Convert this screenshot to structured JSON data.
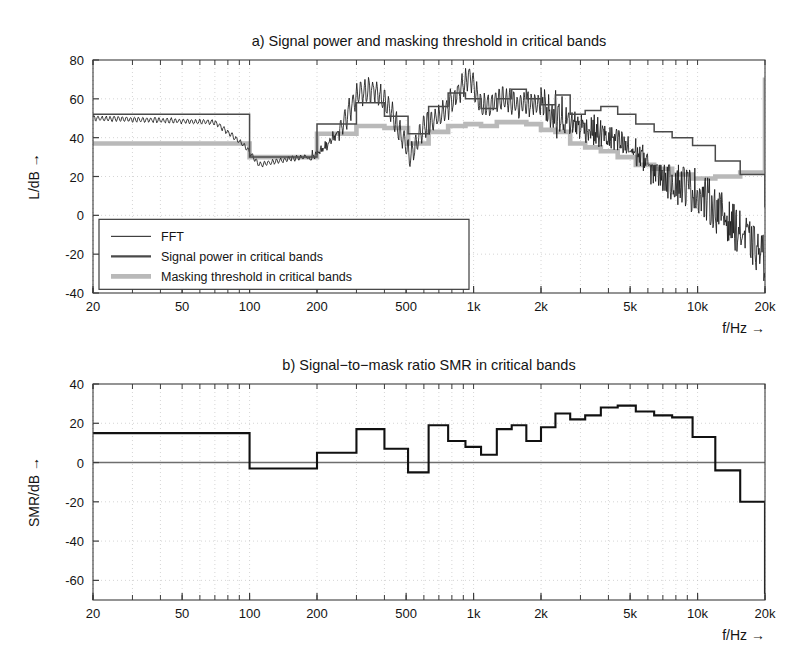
{
  "figure": {
    "width": 809,
    "height": 661,
    "background": "#ffffff"
  },
  "colors": {
    "axis": "#3c3c3c",
    "grid": "#b4b4b4",
    "fft": "#1a1a1a",
    "signal_power": "#4a4a4a",
    "masking_threshold": "#b9b9b9",
    "smr": "#111111",
    "zero_line": "#6e6e6e",
    "legend_border": "#3c3c3c",
    "legend_bg": "#ffffff"
  },
  "chart_data": [
    {
      "id": "panel-a",
      "type": "line",
      "title": "a) Signal power and masking threshold in critical bands",
      "xlabel": "f/Hz →",
      "ylabel": "L/dB →",
      "xscale": "log",
      "xlim": [
        20,
        20000
      ],
      "ylim": [
        -40,
        80
      ],
      "yticks": [
        -40,
        -20,
        0,
        20,
        40,
        60,
        80
      ],
      "ytick_labels": [
        "-40",
        "-20",
        "0",
        "20",
        "40",
        "60",
        "80"
      ],
      "xticks": [
        20,
        50,
        100,
        200,
        500,
        1000,
        2000,
        5000,
        10000,
        20000
      ],
      "xtick_labels": [
        "20",
        "50",
        "100",
        "200",
        "500",
        "1k",
        "2k",
        "5k",
        "10k",
        "20k"
      ],
      "grid": true,
      "legend_position": "lower-left",
      "legend": [
        {
          "label": "FFT",
          "style": "thin-dark-line"
        },
        {
          "label": "Signal power in critical bands",
          "style": "thick-dark-line"
        },
        {
          "label": "Masking threshold in critical bands",
          "style": "thick-gray-line"
        }
      ],
      "series": [
        {
          "name": "Signal power in critical bands",
          "style": "staircase",
          "band_edges": [
            20,
            100,
            200,
            300,
            400,
            510,
            630,
            770,
            920,
            1080,
            1270,
            1480,
            1720,
            2000,
            2320,
            2700,
            3150,
            3700,
            4400,
            5300,
            6400,
            7700,
            9500,
            12000,
            15500,
            20000
          ],
          "values": [
            52,
            30,
            47,
            58,
            51,
            42,
            56,
            63,
            60,
            55,
            60,
            65,
            60,
            57,
            62,
            52,
            54,
            56,
            52,
            47,
            43,
            40,
            36,
            28,
            21,
            4
          ]
        },
        {
          "name": "Masking threshold in critical bands",
          "style": "staircase",
          "band_edges": [
            20,
            100,
            200,
            300,
            400,
            510,
            630,
            770,
            920,
            1080,
            1270,
            1480,
            1720,
            2000,
            2320,
            2700,
            3150,
            3700,
            4400,
            5300,
            6400,
            7700,
            9500,
            12000,
            15500,
            20000
          ],
          "values": [
            37,
            30,
            42,
            46,
            45,
            37,
            43,
            46,
            47,
            46,
            48,
            48,
            47,
            44,
            43,
            37,
            35,
            33,
            30,
            26,
            24,
            21,
            19,
            20,
            22,
            71
          ]
        },
        {
          "name": "FFT",
          "style": "spectrum",
          "description": "Fine-grained FFT magnitude spectrum: flat near 50 dB below 100 Hz, falling to about 26 dB near 110 Hz, rising with strong tonal peaks between 200 Hz and 2 kHz reaching about 72 dB near 1 kHz, then decaying with dense noise to about -30 dB at 20 kHz",
          "anchors_hz": [
            20,
            40,
            70,
            95,
            110,
            150,
            200,
            260,
            300,
            360,
            420,
            480,
            520,
            600,
            700,
            820,
            950,
            1100,
            1300,
            1600,
            2000,
            2500,
            3200,
            4000,
            5000,
            6400,
            8000,
            10000,
            12500,
            16000,
            20000
          ],
          "anchors_db": [
            50,
            49,
            48,
            36,
            26,
            29,
            31,
            46,
            62,
            65,
            55,
            40,
            30,
            46,
            51,
            60,
            72,
            55,
            60,
            57,
            58,
            49,
            45,
            40,
            34,
            26,
            18,
            12,
            2,
            -10,
            -22
          ],
          "noise_floor_db": -35
        }
      ]
    },
    {
      "id": "panel-b",
      "type": "line",
      "title": "b) Signal−to−mask ratio SMR in critical bands",
      "xlabel": "f/Hz →",
      "ylabel": "SMR/dB →",
      "xscale": "log",
      "xlim": [
        20,
        20000
      ],
      "ylim": [
        -70,
        40
      ],
      "yticks": [
        -60,
        -40,
        -20,
        0,
        20,
        40
      ],
      "ytick_labels": [
        "-60",
        "-40",
        "-20",
        "0",
        "20",
        "40"
      ],
      "xticks": [
        20,
        50,
        100,
        200,
        500,
        1000,
        2000,
        5000,
        10000,
        20000
      ],
      "xtick_labels": [
        "20",
        "50",
        "100",
        "200",
        "500",
        "1k",
        "2k",
        "5k",
        "10k",
        "20k"
      ],
      "grid": true,
      "zero_line": true,
      "series": [
        {
          "name": "SMR in critical bands",
          "style": "staircase",
          "band_edges": [
            20,
            100,
            200,
            300,
            400,
            510,
            630,
            770,
            920,
            1080,
            1270,
            1480,
            1720,
            2000,
            2320,
            2700,
            3150,
            3700,
            4400,
            5300,
            6400,
            7700,
            9500,
            12000,
            15500,
            20000
          ],
          "values": [
            15,
            -3,
            5,
            17,
            7,
            -5,
            19,
            11,
            8,
            4,
            17,
            19,
            11,
            18,
            25,
            22,
            24,
            28,
            29,
            26,
            24,
            23,
            13,
            -4,
            -20,
            -67
          ]
        }
      ]
    }
  ]
}
